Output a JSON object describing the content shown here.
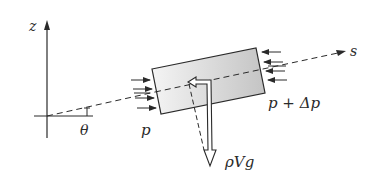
{
  "diagram": {
    "type": "free-body diagram of fluid element along streamline",
    "labels": {
      "z_axis": "z",
      "s_axis": "s",
      "angle": "θ",
      "pressure_left": "p",
      "pressure_right": "p + Δp",
      "weight": "ρVg"
    },
    "colors": {
      "line": "#2a2a2a",
      "element_fill_light": "#f2f2f2",
      "element_fill_dark": "#c8c8c8",
      "background": "#ffffff"
    },
    "elements": [
      "z axis (vertical)",
      "horizontal reference axis",
      "dashed streamline s inclined at angle θ",
      "shaded rectangular fluid element",
      "pressure arrows p acting on left face",
      "pressure arrows p + Δp acting on right face",
      "weight vector ρVg (hollow arrow, downward)",
      "dashed component of weight along s"
    ]
  }
}
